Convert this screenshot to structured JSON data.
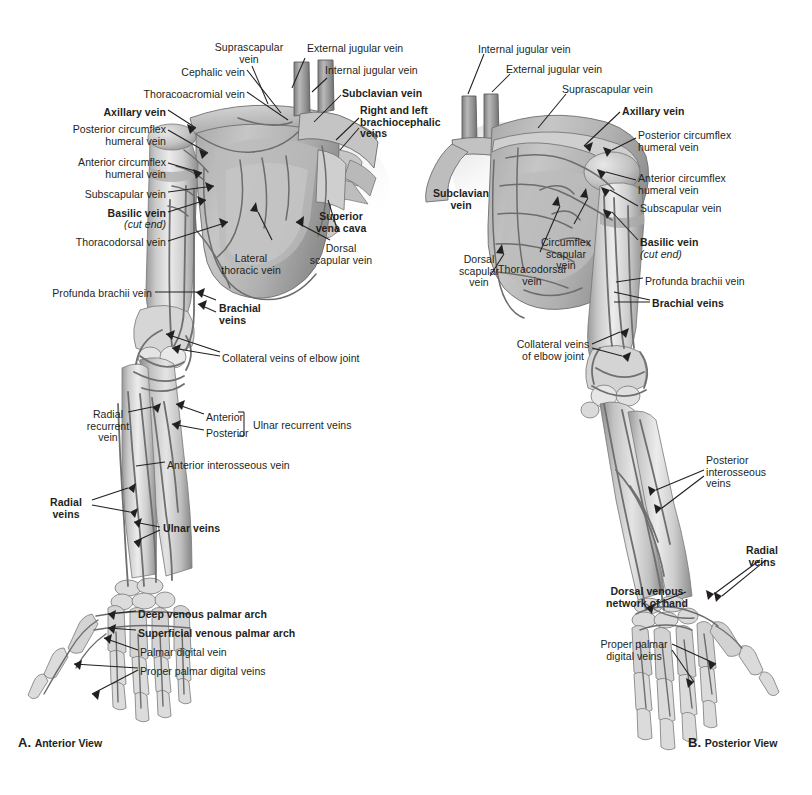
{
  "figure": {
    "background_color": "#ffffff",
    "ink_color": "#231f20",
    "illustration_style": "grayscale anatomical airbrush"
  },
  "panels": [
    {
      "id": "A",
      "letter": "A.",
      "caption": "Anterior View",
      "view": "anterior"
    },
    {
      "id": "B",
      "letter": "B.",
      "caption": "Posterior View",
      "view": "posterior"
    }
  ],
  "labels_a": [
    {
      "id": "a-suprascapular",
      "text": "Suprascapular\nvein",
      "bold": false,
      "align": "center",
      "x": 249,
      "y": 42
    },
    {
      "id": "a-external-jugular",
      "text": "External jugular vein",
      "bold": false,
      "align": "left",
      "x": 307,
      "y": 43
    },
    {
      "id": "a-cephalic",
      "text": "Cephalic vein",
      "bold": false,
      "align": "right",
      "x": 245,
      "y": 67
    },
    {
      "id": "a-internal-jugular",
      "text": "Internal jugular vein",
      "bold": false,
      "align": "left",
      "x": 325,
      "y": 65
    },
    {
      "id": "a-thoracoacromial",
      "text": "Thoracoacromial vein",
      "bold": false,
      "align": "right",
      "x": 245,
      "y": 89
    },
    {
      "id": "a-subclavian",
      "text": "Subclavian vein",
      "bold": true,
      "align": "left",
      "x": 342,
      "y": 88
    },
    {
      "id": "a-axillary",
      "text": "Axillary vein",
      "bold": true,
      "align": "right",
      "x": 166,
      "y": 107
    },
    {
      "id": "a-brachiocephalic",
      "text": "Right and left\nbrachiocephalic\nveins",
      "bold": true,
      "align": "left",
      "x": 360,
      "y": 105
    },
    {
      "id": "a-post-circumflex",
      "text": "Posterior circumflex\nhumeral vein",
      "bold": false,
      "align": "right",
      "x": 166,
      "y": 124
    },
    {
      "id": "a-ant-circumflex",
      "text": "Anterior circumflex\nhumeral vein",
      "bold": false,
      "align": "right",
      "x": 166,
      "y": 157
    },
    {
      "id": "a-subscapular",
      "text": "Subscapular vein",
      "bold": false,
      "align": "right",
      "x": 166,
      "y": 189
    },
    {
      "id": "a-basilic",
      "text": "Basilic vein",
      "bold": true,
      "align": "right",
      "x": 166,
      "y": 208
    },
    {
      "id": "a-basilic-cutend",
      "text": "(cut end)",
      "bold": false,
      "align": "right",
      "x": 166,
      "y": 219,
      "italic": true
    },
    {
      "id": "a-thoracodorsal",
      "text": "Thoracodorsal vein",
      "bold": false,
      "align": "right",
      "x": 166,
      "y": 237
    },
    {
      "id": "a-superior-vena-cava",
      "text": "Superior\nvena cava",
      "bold": true,
      "align": "center",
      "x": 341,
      "y": 211
    },
    {
      "id": "a-dorsal-scapular",
      "text": "Dorsal\nscapular vein",
      "bold": false,
      "align": "center",
      "x": 341,
      "y": 243
    },
    {
      "id": "a-lateral-thoracic",
      "text": "Lateral\nthoracic vein",
      "bold": false,
      "align": "center",
      "x": 251,
      "y": 253
    },
    {
      "id": "a-profunda-brachii",
      "text": "Profunda brachii vein",
      "bold": false,
      "align": "right",
      "x": 152,
      "y": 288
    },
    {
      "id": "a-brachial",
      "text": "Brachial\nveins",
      "bold": true,
      "align": "left",
      "x": 219,
      "y": 303
    },
    {
      "id": "a-collateral-elbow",
      "text": "Collateral veins of elbow joint",
      "bold": false,
      "align": "left",
      "x": 222,
      "y": 353
    },
    {
      "id": "a-radial-recurrent",
      "text": "Radial\nrecurrent\nvein",
      "bold": false,
      "align": "center",
      "x": 108,
      "y": 409
    },
    {
      "id": "a-ulnar-rec-anterior",
      "text": "Anterior",
      "bold": false,
      "align": "left",
      "x": 206,
      "y": 412
    },
    {
      "id": "a-ulnar-rec-posterior",
      "text": "Posterior",
      "bold": false,
      "align": "left",
      "x": 206,
      "y": 428
    },
    {
      "id": "a-ulnar-recurrent",
      "text": "Ulnar recurrent veins",
      "bold": false,
      "align": "left",
      "x": 253,
      "y": 420
    },
    {
      "id": "a-ant-interosseous",
      "text": "Anterior interosseous vein",
      "bold": false,
      "align": "left",
      "x": 167,
      "y": 460
    },
    {
      "id": "a-radial-veins",
      "text": "Radial\nveins",
      "bold": true,
      "align": "center",
      "x": 66,
      "y": 497
    },
    {
      "id": "a-ulnar-veins",
      "text": "Ulnar veins",
      "bold": true,
      "align": "left",
      "x": 163,
      "y": 523
    },
    {
      "id": "a-deep-palmar-arch",
      "text": "Deep venous palmar arch",
      "bold": true,
      "align": "left",
      "x": 138,
      "y": 609
    },
    {
      "id": "a-superficial-palmar",
      "text": "Superficial venous palmar arch",
      "bold": true,
      "align": "left",
      "x": 138,
      "y": 628
    },
    {
      "id": "a-palmar-digital",
      "text": "Palmar digital vein",
      "bold": false,
      "align": "left",
      "x": 140,
      "y": 647
    },
    {
      "id": "a-proper-palmar-digital",
      "text": "Proper palmar digital veins",
      "bold": false,
      "align": "left",
      "x": 140,
      "y": 666
    }
  ],
  "labels_b": [
    {
      "id": "b-internal-jugular",
      "text": "Internal jugular vein",
      "bold": false,
      "align": "left",
      "x": 478,
      "y": 44
    },
    {
      "id": "b-external-jugular",
      "text": "External jugular vein",
      "bold": false,
      "align": "left",
      "x": 506,
      "y": 64
    },
    {
      "id": "b-suprascapular",
      "text": "Suprascapular vein",
      "bold": false,
      "align": "left",
      "x": 562,
      "y": 84
    },
    {
      "id": "b-axillary",
      "text": "Axillary vein",
      "bold": true,
      "align": "left",
      "x": 622,
      "y": 106
    },
    {
      "id": "b-post-circumflex",
      "text": "Posterior circumflex\nhumeral vein",
      "bold": false,
      "align": "left",
      "x": 638,
      "y": 130
    },
    {
      "id": "b-subclavian",
      "text": "Subclavian\nvein",
      "bold": true,
      "align": "center",
      "x": 461,
      "y": 188
    },
    {
      "id": "b-ant-circumflex",
      "text": "Anterior circumflex\nhumeral vein",
      "bold": false,
      "align": "left",
      "x": 638,
      "y": 173
    },
    {
      "id": "b-subscapular",
      "text": "Subscapular vein",
      "bold": false,
      "align": "left",
      "x": 640,
      "y": 203
    },
    {
      "id": "b-basilic",
      "text": "Basilic vein",
      "bold": true,
      "align": "left",
      "x": 640,
      "y": 237
    },
    {
      "id": "b-basilic-cutend",
      "text": "(cut end)",
      "bold": false,
      "align": "left",
      "x": 640,
      "y": 249,
      "italic": true
    },
    {
      "id": "b-profunda-brachii",
      "text": "Profunda brachii vein",
      "bold": false,
      "align": "left",
      "x": 645,
      "y": 276
    },
    {
      "id": "b-brachial",
      "text": "Brachial veins",
      "bold": true,
      "align": "left",
      "x": 652,
      "y": 298
    },
    {
      "id": "b-circumflex-scapular",
      "text": "Circumflex\nscapular\nvein",
      "bold": false,
      "align": "center",
      "x": 566,
      "y": 237
    },
    {
      "id": "b-thoracodorsal",
      "text": "Thoracodorsal\nvein",
      "bold": false,
      "align": "center",
      "x": 532,
      "y": 264
    },
    {
      "id": "b-dorsal-scapular",
      "text": "Dorsal\nscapular\nvein",
      "bold": false,
      "align": "center",
      "x": 479,
      "y": 254
    },
    {
      "id": "b-collateral-elbow",
      "text": "Collateral veins\nof elbow joint",
      "bold": false,
      "align": "center",
      "x": 553,
      "y": 339
    },
    {
      "id": "b-post-interosseous",
      "text": "Posterior\ninterosseous\nveins",
      "bold": false,
      "align": "left",
      "x": 706,
      "y": 455
    },
    {
      "id": "b-radial-veins",
      "text": "Radial\nveins",
      "bold": true,
      "align": "center",
      "x": 762,
      "y": 545
    },
    {
      "id": "b-dorsal-venous-network",
      "text": "Dorsal venous\nnetwork of hand",
      "bold": true,
      "align": "center",
      "x": 647,
      "y": 586
    },
    {
      "id": "b-proper-palmar-digital",
      "text": "Proper palmar\ndigital veins",
      "bold": false,
      "align": "center",
      "x": 634,
      "y": 639
    }
  ],
  "captions": {
    "a": {
      "letter": "A.",
      "text": "Anterior View",
      "x": 18,
      "y": 735
    },
    "b": {
      "letter": "B.",
      "text": "Posterior View",
      "x": 688,
      "y": 735
    }
  }
}
